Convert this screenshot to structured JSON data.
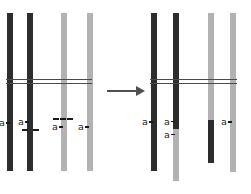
{
  "figure": {
    "type": "unequal-crossover-chromatid-diagram",
    "colors": {
      "background": "#ffffff",
      "dark_chromatid": "#2d2d2d",
      "light_chromatid": "#b2b2b2",
      "pair_line": "#4a4a4a",
      "label_text": "#1a1a1a",
      "arrow": "#4f4f4f"
    },
    "before": {
      "chromatid_1_label": "a",
      "chromatid_2_label": "a",
      "chromatid_3_label": "a",
      "chromatid_4_label": "a"
    },
    "arrow": {
      "icon": "arrow-right-icon",
      "direction": "right"
    },
    "after": {
      "chromatid_1_label": "a",
      "chromatid_2_label_top": "a",
      "chromatid_2_label_bottom": "a",
      "chromatid_4_label": "a"
    }
  }
}
